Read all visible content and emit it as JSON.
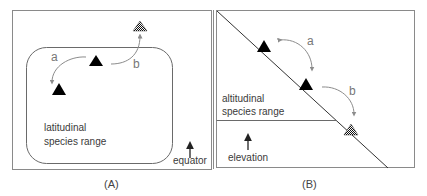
{
  "figure": {
    "panels": [
      {
        "id": "A",
        "caption": "(A)",
        "range_label_line1": "latitudinal",
        "range_label_line2": "species range",
        "direction_label": "equator",
        "arrow_labels": {
          "a": "a",
          "b": "b"
        }
      },
      {
        "id": "B",
        "caption": "(B)",
        "range_label_line1": "altitudinal",
        "range_label_line2": "species range",
        "direction_label": "elevation",
        "arrow_labels": {
          "a": "a",
          "b": "b"
        }
      }
    ],
    "legend_semantics": {
      "solid_triangle": "population within range",
      "checkered_triangle": "population outside range"
    },
    "colors": {
      "frame": "#8a8a8a",
      "range_outline": "#6a6a6a",
      "triangle": "#000000",
      "arrow": "#8c8c8c",
      "text": "#3a3a3a"
    }
  }
}
